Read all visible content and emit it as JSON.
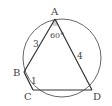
{
  "diagram": {
    "type": "cyclic-quadrilateral",
    "circle": {
      "cx": 62,
      "cy": 58,
      "r": 39,
      "stroke": "#555555"
    },
    "points": {
      "A": {
        "label": "A",
        "x": 55,
        "y": 19
      },
      "B": {
        "label": "B",
        "x": 24,
        "y": 72
      },
      "C": {
        "label": "C",
        "x": 33,
        "y": 90
      },
      "D": {
        "label": "D",
        "x": 92,
        "y": 90
      }
    },
    "segments": [
      {
        "from": "A",
        "to": "B",
        "length_label": "3"
      },
      {
        "from": "B",
        "to": "C",
        "length_label": "1"
      },
      {
        "from": "C",
        "to": "D",
        "length_label": ""
      },
      {
        "from": "D",
        "to": "A",
        "length_label": "4"
      }
    ],
    "angle": {
      "vertex": "A",
      "label": "60°",
      "fill": "#cccccc"
    }
  }
}
